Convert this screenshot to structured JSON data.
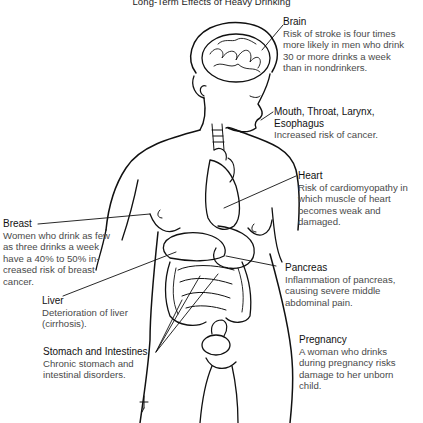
{
  "title": "Long-Term Effects of Heavy Drinking",
  "annotations": [
    {
      "id": "brain",
      "heading": "Brain",
      "body": [
        "Risk of stroke is four times",
        "more likely in men who drink",
        "30 or more drinks a week",
        "than in nondrinkers."
      ]
    },
    {
      "id": "mouth",
      "heading": "Mouth, Throat, Larynx, Esophagus",
      "body": [
        "Increased risk of cancer."
      ]
    },
    {
      "id": "heart",
      "heading": "Heart",
      "body": [
        "Risk of cardiomyopathy in",
        "which muscle of heart",
        "becomes  weak and",
        "damaged."
      ]
    },
    {
      "id": "breast",
      "heading": "Breast",
      "body": [
        "Women who drink as few",
        "as three drinks a week",
        "have a 40% to 50% in-",
        "creased risk of breast",
        "cancer."
      ]
    },
    {
      "id": "pancreas",
      "heading": "Pancreas",
      "body": [
        "Inflammation of pancreas,",
        "causing severe middle",
        "abdominal pain."
      ]
    },
    {
      "id": "liver",
      "heading": "Liver",
      "body": [
        "Deterioration of liver",
        "(cirrhosis)."
      ]
    },
    {
      "id": "stomach",
      "heading": "Stomach and Intestines",
      "body": [
        "Chronic stomach and",
        "intestinal disorders."
      ]
    },
    {
      "id": "pregnancy",
      "heading": "Pregnancy",
      "body": [
        "A woman who drinks",
        "during pregnancy risks",
        "damage to her unborn",
        "child."
      ]
    }
  ],
  "illustration": {
    "subject": "female-body-anatomy-outline",
    "organs_shown": [
      "brain",
      "trachea",
      "heart",
      "stomach",
      "liver",
      "intestines",
      "bladder",
      "uterus"
    ],
    "line_color": "#111111"
  }
}
